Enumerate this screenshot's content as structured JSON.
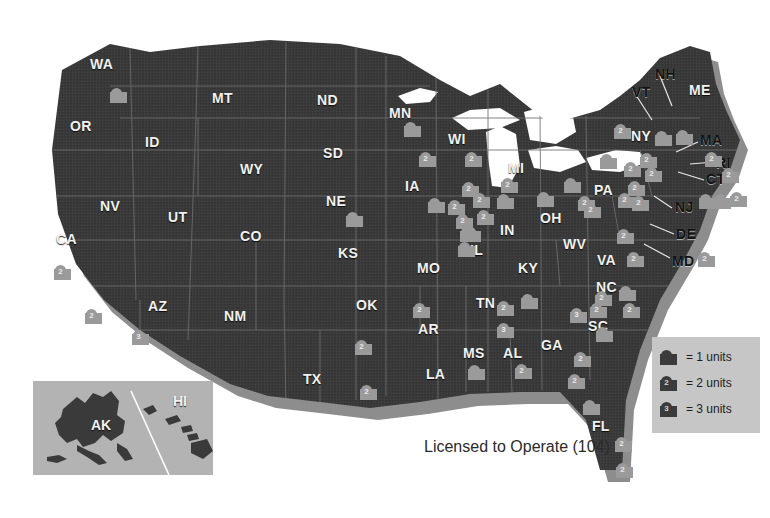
{
  "title": "Licensed to Operate (104)",
  "legend": {
    "rows": [
      {
        "icon": "reactor-marker-icon",
        "count": "",
        "label": "= 1 units"
      },
      {
        "icon": "reactor-marker-icon",
        "count": "2",
        "label": "= 2 units"
      },
      {
        "icon": "reactor-marker-icon",
        "count": "3",
        "label": "= 3 units"
      }
    ]
  },
  "inset": {
    "labels": [
      {
        "name": "AK",
        "x": 58,
        "y": 36
      },
      {
        "name": "HI",
        "x": 140,
        "y": 12
      }
    ]
  },
  "colors": {
    "page_background": "#ffffff",
    "land": "#3a3a3a",
    "land_shadow": "#8d8d8d",
    "water": "#ffffff",
    "border": "#6f6f6f",
    "marker_light": "#9a9a9a",
    "marker_dark": "#3b3b3b",
    "legend_background": "#c6c6c6",
    "inset_background": "#b3b3b3",
    "state_label": "#f2f2f2",
    "title_text": "#2a2a2a"
  },
  "states": [
    {
      "name": "WA",
      "x": 90,
      "y": 56,
      "tone": "light"
    },
    {
      "name": "OR",
      "x": 70,
      "y": 118,
      "tone": "light"
    },
    {
      "name": "ID",
      "x": 145,
      "y": 134,
      "tone": "light"
    },
    {
      "name": "MT",
      "x": 212,
      "y": 90,
      "tone": "light"
    },
    {
      "name": "ND",
      "x": 317,
      "y": 92,
      "tone": "light"
    },
    {
      "name": "SD",
      "x": 323,
      "y": 145,
      "tone": "light"
    },
    {
      "name": "NE",
      "x": 326,
      "y": 193,
      "tone": "light"
    },
    {
      "name": "WY",
      "x": 240,
      "y": 161,
      "tone": "light"
    },
    {
      "name": "NV",
      "x": 100,
      "y": 198,
      "tone": "light"
    },
    {
      "name": "UT",
      "x": 168,
      "y": 209,
      "tone": "light"
    },
    {
      "name": "CO",
      "x": 240,
      "y": 228,
      "tone": "light"
    },
    {
      "name": "KS",
      "x": 338,
      "y": 245,
      "tone": "light"
    },
    {
      "name": "CA",
      "x": 56,
      "y": 231,
      "tone": "light"
    },
    {
      "name": "AZ",
      "x": 148,
      "y": 298,
      "tone": "light"
    },
    {
      "name": "NM",
      "x": 224,
      "y": 308,
      "tone": "light"
    },
    {
      "name": "OK",
      "x": 356,
      "y": 297,
      "tone": "light"
    },
    {
      "name": "TX",
      "x": 303,
      "y": 371,
      "tone": "light"
    },
    {
      "name": "MN",
      "x": 389,
      "y": 105,
      "tone": "light"
    },
    {
      "name": "IA",
      "x": 405,
      "y": 178,
      "tone": "light"
    },
    {
      "name": "MO",
      "x": 417,
      "y": 260,
      "tone": "light"
    },
    {
      "name": "AR",
      "x": 418,
      "y": 321,
      "tone": "light"
    },
    {
      "name": "LA",
      "x": 426,
      "y": 366,
      "tone": "light"
    },
    {
      "name": "WI",
      "x": 448,
      "y": 131,
      "tone": "light"
    },
    {
      "name": "IL",
      "x": 470,
      "y": 242,
      "tone": "light"
    },
    {
      "name": "MI",
      "x": 508,
      "y": 160,
      "tone": "light"
    },
    {
      "name": "IN",
      "x": 500,
      "y": 222,
      "tone": "light"
    },
    {
      "name": "OH",
      "x": 540,
      "y": 210,
      "tone": "light"
    },
    {
      "name": "KY",
      "x": 518,
      "y": 260,
      "tone": "light"
    },
    {
      "name": "TN",
      "x": 476,
      "y": 295,
      "tone": "light"
    },
    {
      "name": "MS",
      "x": 463,
      "y": 345,
      "tone": "light"
    },
    {
      "name": "AL",
      "x": 503,
      "y": 345,
      "tone": "light"
    },
    {
      "name": "GA",
      "x": 541,
      "y": 337,
      "tone": "light"
    },
    {
      "name": "FL",
      "x": 592,
      "y": 418,
      "tone": "light"
    },
    {
      "name": "SC",
      "x": 588,
      "y": 318,
      "tone": "light"
    },
    {
      "name": "NC",
      "x": 596,
      "y": 279,
      "tone": "light"
    },
    {
      "name": "VA",
      "x": 597,
      "y": 252,
      "tone": "light"
    },
    {
      "name": "WV",
      "x": 563,
      "y": 236,
      "tone": "light"
    },
    {
      "name": "PA",
      "x": 594,
      "y": 182,
      "tone": "light"
    },
    {
      "name": "NY",
      "x": 631,
      "y": 128,
      "tone": "light"
    },
    {
      "name": "VT",
      "x": 632,
      "y": 84,
      "tone": "dark"
    },
    {
      "name": "NH",
      "x": 655,
      "y": 66,
      "tone": "dark"
    },
    {
      "name": "ME",
      "x": 689,
      "y": 82,
      "tone": "light"
    },
    {
      "name": "MA",
      "x": 700,
      "y": 132,
      "tone": "dark"
    },
    {
      "name": "RI",
      "x": 716,
      "y": 155,
      "tone": "dark"
    },
    {
      "name": "CT",
      "x": 706,
      "y": 171,
      "tone": "dark"
    },
    {
      "name": "NJ",
      "x": 675,
      "y": 199,
      "tone": "dark"
    },
    {
      "name": "DE",
      "x": 676,
      "y": 226,
      "tone": "dark"
    },
    {
      "name": "MD",
      "x": 672,
      "y": 253,
      "tone": "dark"
    }
  ],
  "markers": [
    {
      "state": "WA",
      "units": "",
      "x": 110,
      "y": 88,
      "shade": "light"
    },
    {
      "state": "CA",
      "units": "2",
      "x": 54,
      "y": 265,
      "shade": "light"
    },
    {
      "state": "CA",
      "units": "2",
      "x": 85,
      "y": 309,
      "shade": "light"
    },
    {
      "state": "AZ",
      "units": "3",
      "x": 132,
      "y": 330,
      "shade": "light"
    },
    {
      "state": "NE",
      "units": "",
      "x": 346,
      "y": 212,
      "shade": "light"
    },
    {
      "state": "MN",
      "units": "",
      "x": 404,
      "y": 122,
      "shade": "light"
    },
    {
      "state": "MN",
      "units": "2",
      "x": 419,
      "y": 152,
      "shade": "light"
    },
    {
      "state": "WI",
      "units": "2",
      "x": 465,
      "y": 152,
      "shade": "light"
    },
    {
      "state": "IA",
      "units": "",
      "x": 428,
      "y": 198,
      "shade": "light"
    },
    {
      "state": "WI",
      "units": "2",
      "x": 462,
      "y": 182,
      "shade": "light"
    },
    {
      "state": "IL",
      "units": "2",
      "x": 448,
      "y": 200,
      "shade": "light"
    },
    {
      "state": "IL",
      "units": "2",
      "x": 473,
      "y": 193,
      "shade": "light"
    },
    {
      "state": "IL",
      "units": "2",
      "x": 477,
      "y": 210,
      "shade": "light"
    },
    {
      "state": "IL",
      "units": "2",
      "x": 456,
      "y": 214,
      "shade": "light"
    },
    {
      "state": "IL",
      "units": "2",
      "x": 460,
      "y": 227,
      "shade": "light"
    },
    {
      "state": "IL",
      "units": "",
      "x": 464,
      "y": 227,
      "shade": "light"
    },
    {
      "state": "IL",
      "units": "",
      "x": 458,
      "y": 242,
      "shade": "light"
    },
    {
      "state": "MI",
      "units": "2",
      "x": 501,
      "y": 178,
      "shade": "light"
    },
    {
      "state": "MI",
      "units": "",
      "x": 497,
      "y": 194,
      "shade": "light"
    },
    {
      "state": "OH",
      "units": "",
      "x": 537,
      "y": 192,
      "shade": "light"
    },
    {
      "state": "OH",
      "units": "",
      "x": 564,
      "y": 178,
      "shade": "light"
    },
    {
      "state": "OH",
      "units": "2",
      "x": 578,
      "y": 196,
      "shade": "light"
    },
    {
      "state": "NY",
      "units": "2",
      "x": 614,
      "y": 124,
      "shade": "light"
    },
    {
      "state": "NY",
      "units": "",
      "x": 655,
      "y": 131,
      "shade": "light"
    },
    {
      "state": "NY",
      "units": "",
      "x": 676,
      "y": 130,
      "shade": "light"
    },
    {
      "state": "NY",
      "units": "2",
      "x": 640,
      "y": 153,
      "shade": "light"
    },
    {
      "state": "PA",
      "units": "",
      "x": 600,
      "y": 154,
      "shade": "light"
    },
    {
      "state": "PA",
      "units": "2",
      "x": 624,
      "y": 162,
      "shade": "light"
    },
    {
      "state": "PA",
      "units": "2",
      "x": 628,
      "y": 181,
      "shade": "light"
    },
    {
      "state": "PA",
      "units": "2",
      "x": 618,
      "y": 193,
      "shade": "light"
    },
    {
      "state": "PA",
      "units": "2",
      "x": 632,
      "y": 196,
      "shade": "light"
    },
    {
      "state": "PA",
      "units": "2",
      "x": 645,
      "y": 167,
      "shade": "light"
    },
    {
      "state": "PA",
      "units": "2",
      "x": 584,
      "y": 203,
      "shade": "light"
    },
    {
      "state": "NJ",
      "units": "",
      "x": 699,
      "y": 194,
      "shade": "light"
    },
    {
      "state": "NJ",
      "units": "",
      "x": 714,
      "y": 194,
      "shade": "light"
    },
    {
      "state": "NJ",
      "units": "2",
      "x": 730,
      "y": 192,
      "shade": "light"
    },
    {
      "state": "CT",
      "units": "2",
      "x": 722,
      "y": 168,
      "shade": "light"
    },
    {
      "state": "MA",
      "units": "2",
      "x": 705,
      "y": 152,
      "shade": "light"
    },
    {
      "state": "MD",
      "units": "2",
      "x": 698,
      "y": 252,
      "shade": "light"
    },
    {
      "state": "VA",
      "units": "2",
      "x": 617,
      "y": 229,
      "shade": "light"
    },
    {
      "state": "VA",
      "units": "2",
      "x": 627,
      "y": 252,
      "shade": "light"
    },
    {
      "state": "NC",
      "units": "2",
      "x": 595,
      "y": 291,
      "shade": "light"
    },
    {
      "state": "NC",
      "units": "2",
      "x": 590,
      "y": 303,
      "shade": "light"
    },
    {
      "state": "NC",
      "units": "2",
      "x": 623,
      "y": 303,
      "shade": "light"
    },
    {
      "state": "NC",
      "units": "",
      "x": 619,
      "y": 286,
      "shade": "light"
    },
    {
      "state": "SC",
      "units": "3",
      "x": 570,
      "y": 308,
      "shade": "light"
    },
    {
      "state": "SC",
      "units": "",
      "x": 596,
      "y": 327,
      "shade": "light"
    },
    {
      "state": "GA",
      "units": "2",
      "x": 574,
      "y": 352,
      "shade": "light"
    },
    {
      "state": "GA",
      "units": "2",
      "x": 568,
      "y": 374,
      "shade": "light"
    },
    {
      "state": "TN",
      "units": "2",
      "x": 497,
      "y": 301,
      "shade": "light"
    },
    {
      "state": "TN",
      "units": "",
      "x": 521,
      "y": 294,
      "shade": "light"
    },
    {
      "state": "AL",
      "units": "3",
      "x": 497,
      "y": 323,
      "shade": "light"
    },
    {
      "state": "AL",
      "units": "2",
      "x": 515,
      "y": 364,
      "shade": "light"
    },
    {
      "state": "MS",
      "units": "",
      "x": 468,
      "y": 365,
      "shade": "light"
    },
    {
      "state": "AR",
      "units": "2",
      "x": 413,
      "y": 303,
      "shade": "light"
    },
    {
      "state": "TX",
      "units": "2",
      "x": 355,
      "y": 340,
      "shade": "light"
    },
    {
      "state": "TX",
      "units": "2",
      "x": 360,
      "y": 385,
      "shade": "light"
    },
    {
      "state": "FL",
      "units": "",
      "x": 583,
      "y": 400,
      "shade": "light"
    },
    {
      "state": "FL",
      "units": "2",
      "x": 615,
      "y": 437,
      "shade": "light"
    },
    {
      "state": "FL",
      "units": "2",
      "x": 616,
      "y": 463,
      "shade": "light"
    }
  ]
}
